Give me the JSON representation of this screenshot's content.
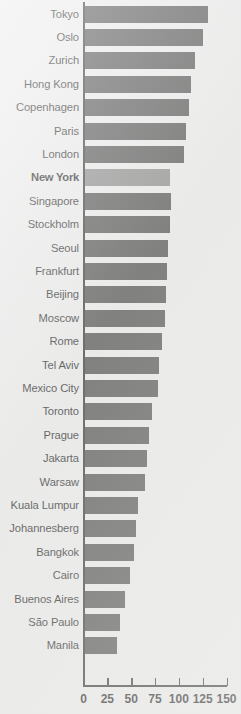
{
  "chart_data": {
    "type": "bar",
    "orientation": "horizontal",
    "title": "",
    "xlabel": "",
    "ylabel": "",
    "xlim": [
      0,
      150
    ],
    "xticks": [
      0,
      25,
      50,
      75,
      100,
      125,
      150
    ],
    "xtick_labels": [
      "0",
      "25",
      "50",
      "75",
      "100",
      "125",
      "150"
    ],
    "grid": false,
    "legend": null,
    "highlight_category": "New York",
    "colors": {
      "bar": "#494949",
      "bar_highlight": "#848484",
      "axis": "#2b2b2b",
      "background": "#ebebeb",
      "text": "#1a1a1a"
    },
    "categories": [
      "Tokyo",
      "Oslo",
      "Zurich",
      "Hong Kong",
      "Copenhagen",
      "Paris",
      "London",
      "New York",
      "Singapore",
      "Stockholm",
      "Seoul",
      "Frankfurt",
      "Beijing",
      "Moscow",
      "Rome",
      "Tel Aviv",
      "Mexico City",
      "Toronto",
      "Prague",
      "Jakarta",
      "Warsaw",
      "Kuala Lumpur",
      "Johannesberg",
      "Bangkok",
      "Cairo",
      "Buenos Aires",
      "São Paulo",
      "Manila"
    ],
    "values": [
      131,
      125,
      117,
      113,
      111,
      108,
      105,
      91,
      92,
      91,
      89,
      88,
      87,
      85,
      82,
      79,
      78,
      72,
      69,
      67,
      64,
      57,
      55,
      53,
      49,
      44,
      38,
      35
    ],
    "bars": [
      {
        "label": "Tokyo",
        "value": 131,
        "highlight": false
      },
      {
        "label": "Oslo",
        "value": 125,
        "highlight": false
      },
      {
        "label": "Zurich",
        "value": 117,
        "highlight": false
      },
      {
        "label": "Hong Kong",
        "value": 113,
        "highlight": false
      },
      {
        "label": "Copenhagen",
        "value": 111,
        "highlight": false
      },
      {
        "label": "Paris",
        "value": 108,
        "highlight": false
      },
      {
        "label": "London",
        "value": 105,
        "highlight": false
      },
      {
        "label": "New York",
        "value": 91,
        "highlight": true
      },
      {
        "label": "Singapore",
        "value": 92,
        "highlight": false
      },
      {
        "label": "Stockholm",
        "value": 91,
        "highlight": false
      },
      {
        "label": "Seoul",
        "value": 89,
        "highlight": false
      },
      {
        "label": "Frankfurt",
        "value": 88,
        "highlight": false
      },
      {
        "label": "Beijing",
        "value": 87,
        "highlight": false
      },
      {
        "label": "Moscow",
        "value": 85,
        "highlight": false
      },
      {
        "label": "Rome",
        "value": 82,
        "highlight": false
      },
      {
        "label": "Tel Aviv",
        "value": 79,
        "highlight": false
      },
      {
        "label": "Mexico City",
        "value": 78,
        "highlight": false
      },
      {
        "label": "Toronto",
        "value": 72,
        "highlight": false
      },
      {
        "label": "Prague",
        "value": 69,
        "highlight": false
      },
      {
        "label": "Jakarta",
        "value": 67,
        "highlight": false
      },
      {
        "label": "Warsaw",
        "value": 64,
        "highlight": false
      },
      {
        "label": "Kuala Lumpur",
        "value": 57,
        "highlight": false
      },
      {
        "label": "Johannesberg",
        "value": 55,
        "highlight": false
      },
      {
        "label": "Bangkok",
        "value": 53,
        "highlight": false
      },
      {
        "label": "Cairo",
        "value": 49,
        "highlight": false
      },
      {
        "label": "Buenos Aires",
        "value": 44,
        "highlight": false
      },
      {
        "label": "São Paulo",
        "value": 38,
        "highlight": false
      },
      {
        "label": "Manila",
        "value": 35,
        "highlight": false
      }
    ]
  }
}
